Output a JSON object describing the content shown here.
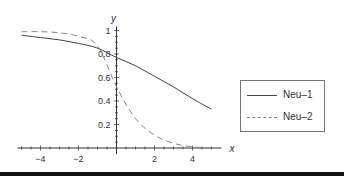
{
  "chart_data": {
    "type": "line",
    "title": "",
    "xlabel": "x",
    "ylabel": "y",
    "xlim": [
      -5,
      5
    ],
    "ylim": [
      0,
      1
    ],
    "grid": false,
    "legend_position": "right",
    "x_ticks": [
      "-4",
      "-2",
      "2",
      "4"
    ],
    "y_ticks": [
      "0.2",
      "0.4",
      "0.6",
      "0.8",
      "1"
    ],
    "x": [
      -5,
      -4,
      -3,
      -2,
      -1,
      0,
      1,
      2,
      3,
      4,
      5
    ],
    "series": [
      {
        "name": "Neu–1",
        "style": "solid",
        "color": "#444444",
        "values": [
          0.96,
          0.94,
          0.92,
          0.89,
          0.85,
          0.77,
          0.7,
          0.61,
          0.52,
          0.42,
          0.33
        ]
      },
      {
        "name": "Neu–2",
        "style": "dashed",
        "color": "#888888",
        "values": [
          0.99,
          0.99,
          0.98,
          0.95,
          0.87,
          0.52,
          0.25,
          0.11,
          0.04,
          0.01,
          0.0
        ]
      }
    ]
  },
  "legend": {
    "items": [
      {
        "label": "Neu–1"
      },
      {
        "label": "Neu–2"
      }
    ]
  }
}
